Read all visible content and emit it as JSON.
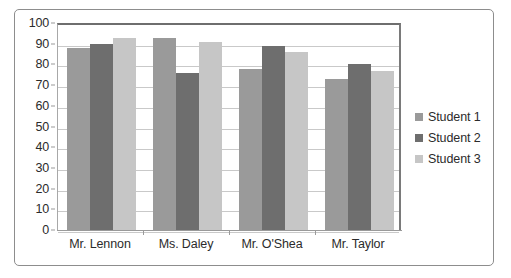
{
  "chart_data": {
    "type": "bar",
    "title": "",
    "xlabel": "",
    "ylabel": "",
    "ylim": [
      0,
      100
    ],
    "ytick_step": 10,
    "yticks": [
      0,
      10,
      20,
      30,
      40,
      50,
      60,
      70,
      80,
      90,
      100
    ],
    "grid": true,
    "legend_position": "right",
    "categories": [
      "Mr. Lennon",
      "Ms. Daley",
      "Mr. O'Shea",
      "Mr. Taylor"
    ],
    "series": [
      {
        "name": "Student 1",
        "color": "#9a9a9a",
        "values": [
          88,
          93,
          78,
          73
        ]
      },
      {
        "name": "Student 2",
        "color": "#6e6e6e",
        "values": [
          90,
          76,
          89,
          80
        ]
      },
      {
        "name": "Student 3",
        "color": "#c6c6c6",
        "values": [
          93,
          91,
          86,
          77
        ]
      }
    ]
  },
  "legend": {
    "items": [
      {
        "label": "Student 1"
      },
      {
        "label": "Student 2"
      },
      {
        "label": "Student 3"
      }
    ]
  },
  "colors": {
    "series_1": "#9a9a9a",
    "series_2": "#6e6e6e",
    "series_3": "#c6c6c6",
    "gridline": "#c9c9c9",
    "axis": "#9a9a9a",
    "border": "#8d8d8d",
    "text": "#2b2b2b"
  }
}
